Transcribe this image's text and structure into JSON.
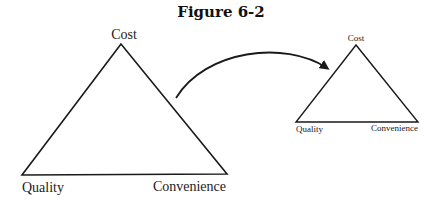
{
  "figure": {
    "title": "Figure 6-2"
  },
  "large_triangle": {
    "top_label": "Cost",
    "left_label": "Quality",
    "right_label": "Convenience"
  },
  "small_triangle": {
    "top_label": "Cost",
    "left_label": "Quality",
    "right_label": "Convenience"
  },
  "colors": {
    "stroke": "#1a1a1a",
    "text": "#222222"
  }
}
